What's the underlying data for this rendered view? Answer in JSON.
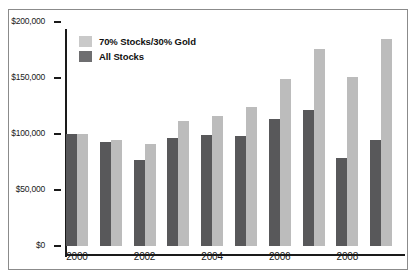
{
  "chart_data": {
    "type": "bar",
    "title": "",
    "subtitle": "",
    "xlabel": "",
    "ylabel": "",
    "categories": [
      "2000",
      "2001",
      "2002",
      "2003",
      "2004",
      "2005",
      "2006",
      "2007",
      "2008",
      "2009"
    ],
    "tick_categories": [
      "2000",
      "2002",
      "2004",
      "2006",
      "2008"
    ],
    "series": [
      {
        "name": "70% Stocks/30% Gold",
        "color": "#bcbcbc",
        "values": [
          100000,
          95000,
          91000,
          112000,
          116000,
          124000,
          149000,
          176000,
          151000,
          185000
        ]
      },
      {
        "name": "All Stocks",
        "color": "#58585a",
        "values": [
          100000,
          93000,
          77000,
          96000,
          99000,
          98000,
          113000,
          121000,
          79000,
          95000
        ]
      }
    ],
    "ylim": [
      0,
      200000
    ],
    "ytick_values": [
      0,
      50000,
      100000,
      150000,
      200000
    ],
    "ytick_labels": [
      "$0",
      "$50,000",
      "$100,000",
      "$150,000",
      "$200,000"
    ],
    "grid": false,
    "legend_position": "top-left",
    "annotations": []
  },
  "legend": {
    "items": [
      {
        "label": "70% Stocks/30% Gold",
        "swatch": "light"
      },
      {
        "label": "All Stocks",
        "swatch": "dark"
      }
    ]
  },
  "colors": {
    "series_light": "#bcbcbc",
    "series_dark": "#58585a",
    "axis": "#1a1a1a",
    "frame": "#8b8b8b",
    "background": "#ffffff"
  }
}
